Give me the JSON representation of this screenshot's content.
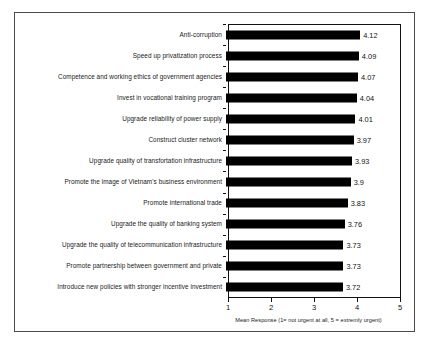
{
  "chart_data": {
    "type": "bar",
    "orientation": "horizontal",
    "title": "",
    "subtitle": "",
    "xlabel": "Mean Response (1= not urgent at all, 5 = extremly urgent)",
    "ylabel": "",
    "xlim": [
      1,
      5
    ],
    "xticks": [
      1,
      2,
      3,
      4,
      5
    ],
    "xtick_labels": [
      "1",
      "2",
      "3",
      "4",
      "5"
    ],
    "grid": false,
    "legend": null,
    "legend_position": "none",
    "categories": [
      "Anti-corruption",
      "Speed up privatization process",
      "Competence and working ethics of government agencies",
      "Invest in vocational training program",
      "Upgrade reliability of power supply",
      "Construct cluster network",
      "Upgrade quality of transfortation infrastructure",
      "Promote the image of Vietnam's business environment",
      "Promote international trade",
      "Upgrade  the quality of banking system",
      "Upgrade the quality of telecommunication infrastructure",
      "Promote partnership between government and private",
      "Introduce new policies with stronger incentive investment"
    ],
    "values": [
      4.12,
      4.09,
      4.07,
      4.04,
      4.01,
      3.97,
      3.93,
      3.9,
      3.83,
      3.76,
      3.73,
      3.73,
      3.72
    ],
    "value_labels": [
      "4.12",
      "4.09",
      "4.07",
      "4.04",
      "4.01",
      "3.97",
      "3.93",
      "3.9",
      "3.83",
      "3.76",
      "3.73",
      "3.73",
      "3.72"
    ],
    "bar_color": "#000000",
    "axis_color": "#111111",
    "background_color": "#ffffff"
  }
}
